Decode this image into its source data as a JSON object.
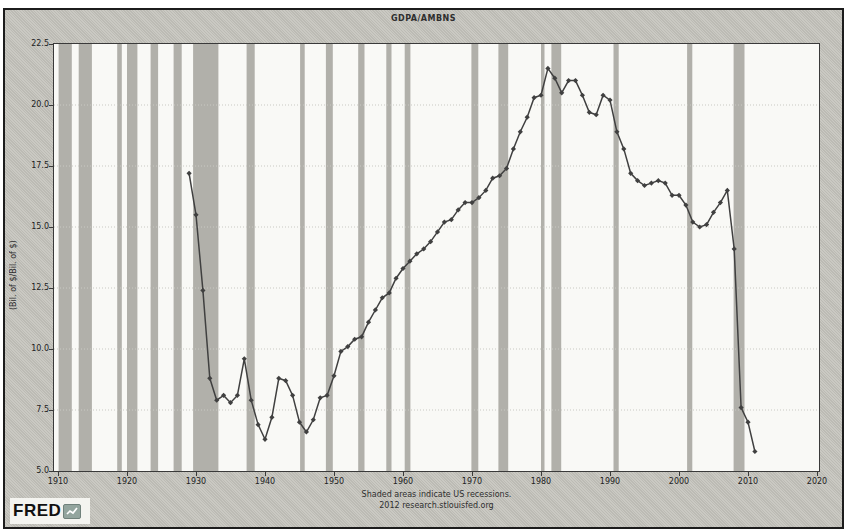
{
  "header": {
    "title": "GDPA/AMBNS"
  },
  "y_axis": {
    "label": "(Bil. of $/Bil. of $)",
    "ticks": [
      "22.5",
      "20.0",
      "17.5",
      "15.0",
      "12.5",
      "10.0",
      "7.5",
      "5.0"
    ]
  },
  "x_axis": {
    "ticks": [
      "1910",
      "1920",
      "1930",
      "1940",
      "1950",
      "1960",
      "1970",
      "1980",
      "1990",
      "2000",
      "2010",
      "2020"
    ]
  },
  "footer": {
    "line1": "Shaded areas indicate US recessions.",
    "line2": "2012 research.stlouisfed.org"
  },
  "logo": {
    "text": "FRED"
  },
  "colors": {
    "frame_background": "#c6c5be",
    "frame_border": "#1c1c1c",
    "plot_background": "#f9f9f6",
    "plot_border": "#3a3a3a",
    "recession_band": "#b1b0aa",
    "gridline": "#c9c9c3",
    "line": "#404040",
    "text": "#222222",
    "logo_icon": "#93a59e"
  },
  "chart_data": {
    "type": "line",
    "title": "GDPA/AMBNS",
    "xlabel": "",
    "ylabel": "(Bil. of $/Bil. of $)",
    "xlim": [
      1910,
      2020
    ],
    "ylim": [
      5.0,
      22.5
    ],
    "x_ticks": [
      1910,
      1920,
      1930,
      1940,
      1950,
      1960,
      1970,
      1980,
      1990,
      2000,
      2010,
      2020
    ],
    "y_ticks": [
      5.0,
      7.5,
      10.0,
      12.5,
      15.0,
      17.5,
      20.0,
      22.5
    ],
    "grid": "horizontal-dotted",
    "legend": "none",
    "marker": "diamond",
    "annotation": "Shaded areas indicate US recessions.",
    "series": [
      {
        "name": "GDPA/AMBNS",
        "x": [
          1929,
          1930,
          1931,
          1932,
          1933,
          1934,
          1935,
          1936,
          1937,
          1938,
          1939,
          1940,
          1941,
          1942,
          1943,
          1944,
          1945,
          1946,
          1947,
          1948,
          1949,
          1950,
          1951,
          1952,
          1953,
          1954,
          1955,
          1956,
          1957,
          1958,
          1959,
          1960,
          1961,
          1962,
          1963,
          1964,
          1965,
          1966,
          1967,
          1968,
          1969,
          1970,
          1971,
          1972,
          1973,
          1974,
          1975,
          1976,
          1977,
          1978,
          1979,
          1980,
          1981,
          1982,
          1983,
          1984,
          1985,
          1986,
          1987,
          1988,
          1989,
          1990,
          1991,
          1992,
          1993,
          1994,
          1995,
          1996,
          1997,
          1998,
          1999,
          2000,
          2001,
          2002,
          2003,
          2004,
          2005,
          2006,
          2007,
          2008,
          2009,
          2010,
          2011
        ],
        "values": [
          17.2,
          15.5,
          12.4,
          8.8,
          7.9,
          8.1,
          7.8,
          8.1,
          9.6,
          7.9,
          6.9,
          6.3,
          7.2,
          8.8,
          8.7,
          8.1,
          7.0,
          6.6,
          7.1,
          8.0,
          8.1,
          8.9,
          9.9,
          10.1,
          10.4,
          10.5,
          11.1,
          11.6,
          12.1,
          12.3,
          12.9,
          13.3,
          13.6,
          13.9,
          14.1,
          14.4,
          14.8,
          15.2,
          15.3,
          15.7,
          16.0,
          16.0,
          16.2,
          16.5,
          17.0,
          17.1,
          17.4,
          18.2,
          18.9,
          19.5,
          20.3,
          20.4,
          21.5,
          21.1,
          20.5,
          21.0,
          21.0,
          20.4,
          19.7,
          19.6,
          20.4,
          20.2,
          18.9,
          18.2,
          17.2,
          16.9,
          16.7,
          16.8,
          16.9,
          16.8,
          16.3,
          16.3,
          15.9,
          15.2,
          15.0,
          15.1,
          15.6,
          16.0,
          16.5,
          14.1,
          7.6,
          7.0,
          5.8
        ]
      }
    ],
    "recessions": [
      [
        1910.08,
        1912.0
      ],
      [
        1913.0,
        1914.92
      ],
      [
        1918.58,
        1919.25
      ],
      [
        1920.0,
        1921.5
      ],
      [
        1923.42,
        1924.5
      ],
      [
        1926.75,
        1927.92
      ],
      [
        1929.58,
        1933.25
      ],
      [
        1937.33,
        1938.5
      ],
      [
        1945.08,
        1945.75
      ],
      [
        1948.83,
        1949.83
      ],
      [
        1953.5,
        1954.42
      ],
      [
        1957.58,
        1958.33
      ],
      [
        1960.25,
        1961.08
      ],
      [
        1969.92,
        1970.92
      ],
      [
        1973.83,
        1975.25
      ],
      [
        1980.0,
        1980.5
      ],
      [
        1981.5,
        1982.92
      ],
      [
        1990.5,
        1991.25
      ],
      [
        2001.17,
        2001.92
      ],
      [
        2007.92,
        2009.5
      ]
    ]
  }
}
